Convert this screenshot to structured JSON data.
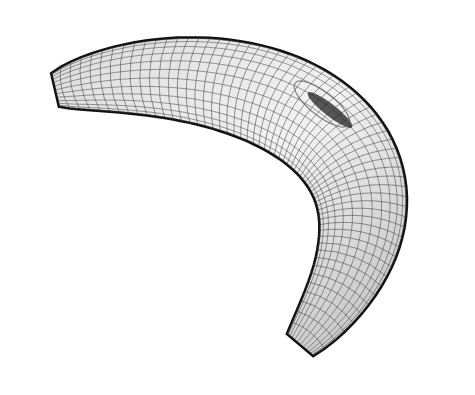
{
  "figure": {
    "background_color": "#ffffff",
    "mesh_color": "#3a3a3a",
    "surface_light": "#ececec",
    "surface_dark": "#9a9a9a",
    "outline_color": "#111111"
  }
}
